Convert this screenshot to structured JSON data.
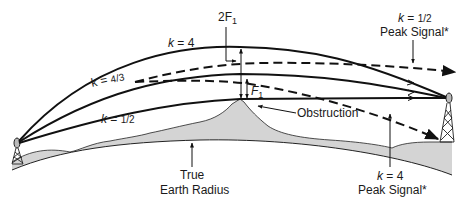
{
  "diagram": {
    "colors": {
      "line": "#111111",
      "terrain_fill": "#d4d4d4",
      "background": "#ffffff"
    },
    "labels": {
      "two_f1": "2F",
      "two_f1_sub": "1",
      "f1": "F",
      "f1_sub": "1",
      "k4_top_k": "k",
      "k4_top_eq": " = 4",
      "k43_k": "k",
      "k43_eq": " = ",
      "k43_frac": "4/3",
      "k12_k": "k",
      "k12_eq": " = ",
      "k12_frac": "1/2",
      "peak_top_k": "k",
      "peak_top_eq": " = ",
      "peak_top_frac": "1/2",
      "peak_top_text": "Peak Signal*",
      "obstruction": "Obstruction",
      "true_earth_line1": "True",
      "true_earth_line2": "Earth Radius",
      "peak_bottom_k": "k",
      "peak_bottom_eq": " = 4",
      "peak_bottom_text": "Peak Signal*"
    },
    "paths": [
      {
        "name": "k-4-path",
        "style": "solid",
        "k": "4"
      },
      {
        "name": "k-4-3-path",
        "style": "solid",
        "k": "4/3"
      },
      {
        "name": "k-1-2-path",
        "style": "solid",
        "k": "1/2"
      },
      {
        "name": "k-1-2-peak-signal-path",
        "style": "dashed",
        "k": "1/2"
      },
      {
        "name": "k-4-peak-signal-path",
        "style": "dashed",
        "k": "4"
      }
    ]
  }
}
